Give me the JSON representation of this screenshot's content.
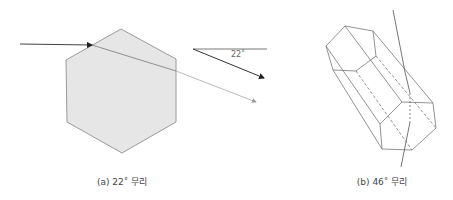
{
  "figures": [
    {
      "id": "a",
      "caption": "(a) 22˚ 무리",
      "angle_label": "22˚",
      "description": "Light ray refracted through a hexagonal ice crystal cross-section"
    },
    {
      "id": "b",
      "caption": "(b) 46˚ 무리",
      "description": "Light ray passing through a hexagonal prism ice crystal"
    }
  ],
  "colors": {
    "crystal_fill": "#e6e6e6",
    "crystal_stroke": "#9a9a9a",
    "ray": "#555555",
    "exit_ray": "#999999",
    "prism_stroke": "#777777"
  }
}
